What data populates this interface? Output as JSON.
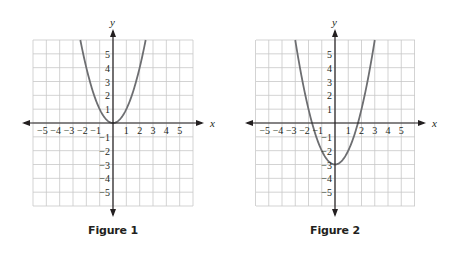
{
  "colors": {
    "grid": "#c8c8c8",
    "axis": "#231f20",
    "curve": "#6d6e71",
    "text": "#231f20"
  },
  "figures": [
    {
      "caption": "Figure 1",
      "x_axis_label": "x",
      "y_axis_label": "y",
      "function": "y = x^2",
      "a": 1,
      "h": 0,
      "k": 0
    },
    {
      "caption": "Figure 2",
      "x_axis_label": "x",
      "y_axis_label": "y",
      "function": "y = x^2 - 3",
      "a": 1,
      "h": 0,
      "k": -3
    }
  ],
  "chart_data": [
    {
      "type": "line",
      "title": "Figure 1",
      "xlabel": "x",
      "ylabel": "y",
      "xlim": [
        -6,
        6
      ],
      "ylim": [
        -6,
        6
      ],
      "grid": true,
      "x_ticks": [
        -5,
        -4,
        -3,
        -2,
        -1,
        1,
        2,
        3,
        4,
        5
      ],
      "y_ticks": [
        -5,
        -4,
        -3,
        -2,
        -1,
        1,
        2,
        3,
        4,
        5
      ],
      "series": [
        {
          "name": "y = x^2",
          "x": [
            -2.45,
            -2,
            -1.5,
            -1,
            -0.5,
            0,
            0.5,
            1,
            1.5,
            2,
            2.45
          ],
          "y": [
            6,
            4,
            2.25,
            1,
            0.25,
            0,
            0.25,
            1,
            2.25,
            4,
            6
          ]
        }
      ],
      "annotations": [
        "vertex at (0, 0)"
      ]
    },
    {
      "type": "line",
      "title": "Figure 2",
      "xlabel": "x",
      "ylabel": "y",
      "xlim": [
        -6,
        6
      ],
      "ylim": [
        -6,
        6
      ],
      "grid": true,
      "x_ticks": [
        -5,
        -4,
        -3,
        -2,
        -1,
        1,
        2,
        3,
        4,
        5
      ],
      "y_ticks": [
        -5,
        -4,
        -3,
        -2,
        -1,
        1,
        2,
        3,
        4,
        5
      ],
      "series": [
        {
          "name": "y = x^2 - 3",
          "x": [
            -3,
            -2.5,
            -2,
            -1.73,
            -1,
            -0.5,
            0,
            0.5,
            1,
            1.73,
            2,
            2.5,
            3
          ],
          "y": [
            6,
            3.25,
            1,
            0,
            -2,
            -2.75,
            -3,
            -2.75,
            -2,
            0,
            1,
            3.25,
            6
          ]
        }
      ],
      "annotations": [
        "vertex at (0, -3)",
        "x-intercepts near ±1.73"
      ]
    }
  ]
}
